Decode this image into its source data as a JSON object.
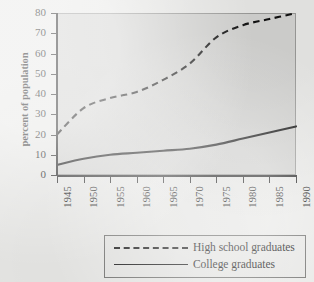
{
  "chart_data": {
    "type": "line",
    "title": "",
    "xlabel": "",
    "ylabel": "percent of population",
    "xlim": [
      1945,
      1990
    ],
    "ylim": [
      0,
      80
    ],
    "grid": false,
    "legend_position": "below-center",
    "x": [
      1945,
      1950,
      1955,
      1960,
      1965,
      1970,
      1975,
      1980,
      1985,
      1990
    ],
    "xticklabels": [
      "1945",
      "1950",
      "1955",
      "1960",
      "1965",
      "1970",
      "1975",
      "1980",
      "1985",
      "1990"
    ],
    "yticks": [
      0,
      10,
      20,
      30,
      40,
      50,
      60,
      70,
      80
    ],
    "yticklabels": [
      "0",
      "10",
      "20",
      "30",
      "40",
      "50",
      "60",
      "70",
      "80"
    ],
    "series": [
      {
        "name": "High school graduates",
        "style": "dashed",
        "color": "#111111",
        "values": [
          20,
          33,
          38,
          41,
          47,
          55,
          68,
          74,
          77,
          80
        ]
      },
      {
        "name": "College graduates",
        "style": "solid",
        "color": "#111111",
        "values": [
          5,
          8,
          10,
          11,
          12,
          13,
          15,
          18,
          21,
          24
        ]
      }
    ]
  },
  "axes": {
    "y_title": "percent of population"
  },
  "legend": {
    "entries": [
      {
        "label": "High school graduates",
        "style": "dashed"
      },
      {
        "label": "College graduates",
        "style": "solid"
      }
    ]
  },
  "colors": {
    "page_background": "#e8e8e6",
    "plot_background": "#d2d2d0",
    "plot_border": "#9a9a98",
    "axis": "#222222",
    "line": "#111111",
    "legend_border": "#6e6e6c"
  }
}
